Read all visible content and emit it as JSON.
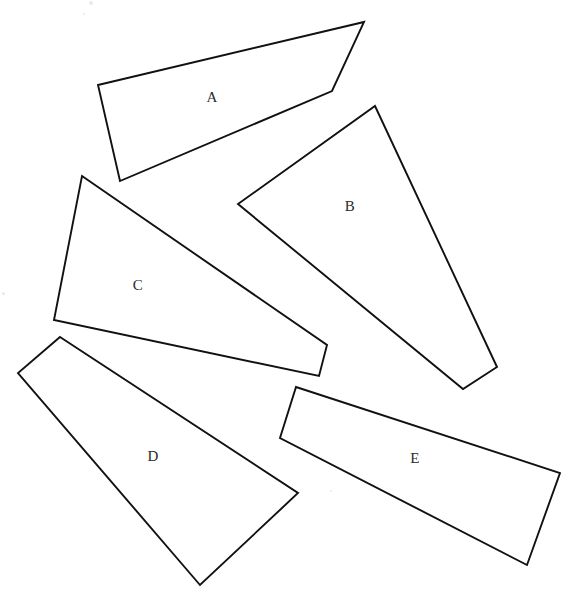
{
  "figure": {
    "canvas": {
      "width": 571,
      "height": 602
    },
    "background_color": "#ffffff",
    "stroke_color": "#111111",
    "label_color": "#2a2a2a",
    "stroke_width": 1.9
  },
  "shapes": [
    {
      "id": "shape-a",
      "label": "A",
      "sides": 4,
      "label_x": 212,
      "label_y": 99,
      "points": "98,85 364,22 332,91 120,181"
    },
    {
      "id": "shape-b",
      "label": "B",
      "sides": 4,
      "label_x": 350,
      "label_y": 208,
      "points": "375,106 497,367 463,389 238,204"
    },
    {
      "id": "shape-c",
      "label": "C",
      "sides": 4,
      "label_x": 138,
      "label_y": 287,
      "points": "82,176 327,345 319,376 54,320"
    },
    {
      "id": "shape-d",
      "label": "D",
      "sides": 4,
      "label_x": 153,
      "label_y": 458,
      "points": "60,337 298,493 200,585 18,373"
    },
    {
      "id": "shape-e",
      "label": "E",
      "sides": 4,
      "label_x": 415,
      "label_y": 460,
      "points": "296,387 560,473 527,565 280,438"
    }
  ],
  "specks": [
    {
      "x": 89,
      "y": 1,
      "size": 4
    },
    {
      "x": 83,
      "y": 13,
      "size": 2
    },
    {
      "x": 2,
      "y": 292,
      "size": 3
    },
    {
      "x": 330,
      "y": 490,
      "size": 2
    }
  ]
}
